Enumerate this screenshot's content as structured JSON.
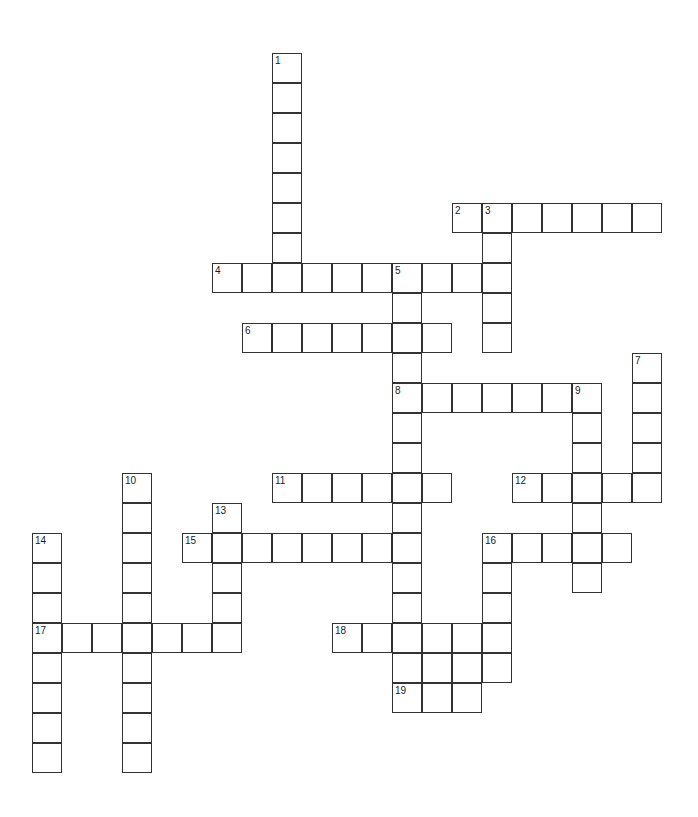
{
  "puzzle": {
    "type": "crossword",
    "cell_size": 30,
    "origin": {
      "x": 32,
      "y": 53
    },
    "colors": {
      "border": "#333333",
      "background": "#ffffff",
      "number": "#222222"
    },
    "words": [
      {
        "number": "1",
        "dir": "down",
        "row": 0,
        "col": 8,
        "length": 8
      },
      {
        "number": "2",
        "dir": "across",
        "row": 5,
        "col": 14,
        "length": 7
      },
      {
        "number": "3",
        "dir": "down",
        "row": 5,
        "col": 15,
        "length": 5
      },
      {
        "number": "4",
        "dir": "across",
        "row": 7,
        "col": 6,
        "length": 10
      },
      {
        "number": "5",
        "dir": "down",
        "row": 7,
        "col": 12,
        "length": 15
      },
      {
        "number": "6",
        "dir": "across",
        "row": 9,
        "col": 7,
        "length": 7
      },
      {
        "number": "7",
        "dir": "down",
        "row": 10,
        "col": 20,
        "length": 5
      },
      {
        "number": "8",
        "dir": "across",
        "row": 11,
        "col": 12,
        "length": 7
      },
      {
        "number": "9",
        "dir": "down",
        "row": 11,
        "col": 18,
        "length": 7
      },
      {
        "number": "10",
        "dir": "down",
        "row": 14,
        "col": 3,
        "length": 10
      },
      {
        "number": "11",
        "dir": "across",
        "row": 14,
        "col": 8,
        "length": 6
      },
      {
        "number": "12",
        "dir": "across",
        "row": 14,
        "col": 16,
        "length": 5
      },
      {
        "number": "13",
        "dir": "down",
        "row": 15,
        "col": 6,
        "length": 5
      },
      {
        "number": "14",
        "dir": "down",
        "row": 16,
        "col": 0,
        "length": 8
      },
      {
        "number": "15",
        "dir": "across",
        "row": 16,
        "col": 5,
        "length": 8
      },
      {
        "number": "16",
        "dir": "across",
        "row": 16,
        "col": 15,
        "length": 5
      },
      {
        "number": "16",
        "dir": "down",
        "row": 16,
        "col": 15,
        "length": 5
      },
      {
        "number": "17",
        "dir": "across",
        "row": 19,
        "col": 0,
        "length": 7
      },
      {
        "number": "18",
        "dir": "across",
        "row": 19,
        "col": 10,
        "length": 6
      },
      {
        "number": "",
        "dir": "across",
        "row": 20,
        "col": 12,
        "length": 4
      },
      {
        "number": "19",
        "dir": "across",
        "row": 21,
        "col": 12,
        "length": 3
      }
    ]
  }
}
